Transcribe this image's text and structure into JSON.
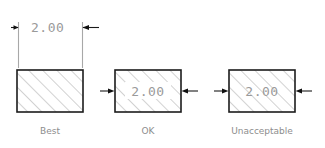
{
  "figure": {
    "background_color": "#ffffff",
    "outline_color": "#1c1c1c",
    "hatch_color": "#9b9b9b",
    "dimension_text_color": "#9a9a9a",
    "caption_color": "#8d8d8d",
    "arrow_color": "#111111",
    "extension_line_color": "#a8a8a8"
  },
  "examples": [
    {
      "id": "best",
      "caption": "Best",
      "dimension_value": "2.00",
      "dimension_placement": "outside-above",
      "arrow_direction": "outward",
      "hatch_through_text": false,
      "text_mask": false
    },
    {
      "id": "ok",
      "caption": "OK",
      "dimension_value": "2.00",
      "dimension_placement": "inside-masked",
      "arrow_direction": "inward",
      "hatch_through_text": false,
      "text_mask": true
    },
    {
      "id": "unacceptable",
      "caption": "Unacceptable",
      "dimension_value": "2.00",
      "dimension_placement": "inside-unmasked",
      "arrow_direction": "inward",
      "hatch_through_text": true,
      "text_mask": false
    }
  ]
}
